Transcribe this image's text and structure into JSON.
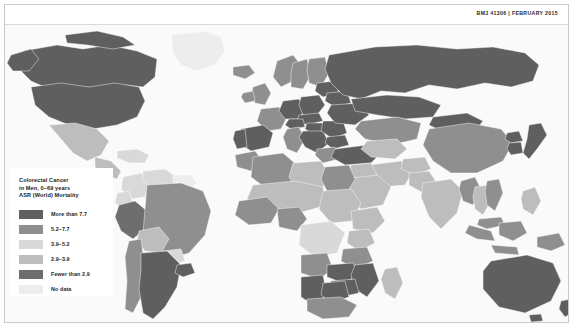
{
  "header": {
    "source_line": "BMJ 41306 | FEBRUARY 2015"
  },
  "legend": {
    "title": "Colorectal Cancer\nin Men, 0–69 years\nASR (World) Mortality",
    "title_line1": "Colorectal Cancer",
    "title_line2": "in Men, 0–69 years",
    "title_line3": "ASR (World) Mortality",
    "items": [
      {
        "label": "More than 7.7",
        "color": "#5f5f5f"
      },
      {
        "label": "5.2–7.7",
        "color": "#8f8f8f"
      },
      {
        "label": "3.9–5.2",
        "color": "#d9d9d9"
      },
      {
        "label": "2.9–3.9",
        "color": "#bdbdbd"
      },
      {
        "label": "Fewer than 2.9",
        "color": "#6e6e6e"
      },
      {
        "label": "No data",
        "color": "#ededed"
      }
    ]
  },
  "map": {
    "background_color": "#fafafa",
    "ocean_color": "#fafafa",
    "border_color": "#ffffff",
    "projection": "equirectangular-world",
    "regions": [
      {
        "name": "Canada",
        "class": "c1"
      },
      {
        "name": "United States",
        "class": "c1"
      },
      {
        "name": "Greenland",
        "class": "c6"
      },
      {
        "name": "Mexico",
        "class": "c4"
      },
      {
        "name": "Central America",
        "class": "c4"
      },
      {
        "name": "Caribbean",
        "class": "c3"
      },
      {
        "name": "Colombia",
        "class": "c3"
      },
      {
        "name": "Venezuela",
        "class": "c3"
      },
      {
        "name": "Guianas",
        "class": "c6"
      },
      {
        "name": "Brazil",
        "class": "c2"
      },
      {
        "name": "Peru",
        "class": "c5"
      },
      {
        "name": "Bolivia",
        "class": "c4"
      },
      {
        "name": "Chile",
        "class": "c2"
      },
      {
        "name": "Argentina",
        "class": "c1"
      },
      {
        "name": "Uruguay",
        "class": "c1"
      },
      {
        "name": "Paraguay",
        "class": "c3"
      },
      {
        "name": "Ecuador",
        "class": "c3"
      },
      {
        "name": "Iceland",
        "class": "c2"
      },
      {
        "name": "Norway",
        "class": "c2"
      },
      {
        "name": "Sweden",
        "class": "c2"
      },
      {
        "name": "Finland",
        "class": "c2"
      },
      {
        "name": "United Kingdom",
        "class": "c2"
      },
      {
        "name": "Ireland",
        "class": "c2"
      },
      {
        "name": "France",
        "class": "c2"
      },
      {
        "name": "Spain",
        "class": "c1"
      },
      {
        "name": "Portugal",
        "class": "c1"
      },
      {
        "name": "Germany",
        "class": "c1"
      },
      {
        "name": "Poland",
        "class": "c1"
      },
      {
        "name": "Czechia",
        "class": "c1"
      },
      {
        "name": "Slovakia",
        "class": "c1"
      },
      {
        "name": "Hungary",
        "class": "c1"
      },
      {
        "name": "Austria",
        "class": "c1"
      },
      {
        "name": "Italy",
        "class": "c2"
      },
      {
        "name": "Balkans",
        "class": "c1"
      },
      {
        "name": "Romania",
        "class": "c1"
      },
      {
        "name": "Bulgaria",
        "class": "c1"
      },
      {
        "name": "Greece",
        "class": "c2"
      },
      {
        "name": "Ukraine",
        "class": "c1"
      },
      {
        "name": "Belarus",
        "class": "c1"
      },
      {
        "name": "Baltics",
        "class": "c1"
      },
      {
        "name": "Russia",
        "class": "c1"
      },
      {
        "name": "Turkey",
        "class": "c1"
      },
      {
        "name": "Kazakhstan",
        "class": "c2"
      },
      {
        "name": "Central Asia",
        "class": "c4"
      },
      {
        "name": "Iran",
        "class": "c4"
      },
      {
        "name": "Iraq",
        "class": "c4"
      },
      {
        "name": "Saudi Arabia",
        "class": "c4"
      },
      {
        "name": "Arabian Peninsula",
        "class": "c4"
      },
      {
        "name": "Egypt",
        "class": "c2"
      },
      {
        "name": "Libya",
        "class": "c4"
      },
      {
        "name": "Algeria",
        "class": "c2"
      },
      {
        "name": "Morocco",
        "class": "c2"
      },
      {
        "name": "Sahel",
        "class": "c4"
      },
      {
        "name": "West Africa",
        "class": "c2"
      },
      {
        "name": "Nigeria",
        "class": "c2"
      },
      {
        "name": "Sudan",
        "class": "c4"
      },
      {
        "name": "Ethiopia",
        "class": "c4"
      },
      {
        "name": "Kenya",
        "class": "c4"
      },
      {
        "name": "DR Congo",
        "class": "c3"
      },
      {
        "name": "Angola",
        "class": "c2"
      },
      {
        "name": "Tanzania",
        "class": "c2"
      },
      {
        "name": "Zambia",
        "class": "c1"
      },
      {
        "name": "Zimbabwe",
        "class": "c1"
      },
      {
        "name": "Mozambique",
        "class": "c1"
      },
      {
        "name": "Namibia",
        "class": "c1"
      },
      {
        "name": "Botswana",
        "class": "c1"
      },
      {
        "name": "South Africa",
        "class": "c2"
      },
      {
        "name": "Madagascar",
        "class": "c4"
      },
      {
        "name": "India",
        "class": "c4"
      },
      {
        "name": "Pakistan",
        "class": "c4"
      },
      {
        "name": "Afghanistan",
        "class": "c4"
      },
      {
        "name": "China",
        "class": "c2"
      },
      {
        "name": "Mongolia",
        "class": "c1"
      },
      {
        "name": "Japan",
        "class": "c1"
      },
      {
        "name": "South Korea",
        "class": "c1"
      },
      {
        "name": "North Korea",
        "class": "c1"
      },
      {
        "name": "Myanmar",
        "class": "c2"
      },
      {
        "name": "Thailand",
        "class": "c4"
      },
      {
        "name": "Vietnam",
        "class": "c2"
      },
      {
        "name": "Indonesia",
        "class": "c2"
      },
      {
        "name": "Malaysia",
        "class": "c2"
      },
      {
        "name": "Philippines",
        "class": "c4"
      },
      {
        "name": "Papua New Guinea",
        "class": "c2"
      },
      {
        "name": "Australia",
        "class": "c1"
      },
      {
        "name": "New Zealand",
        "class": "c1"
      }
    ]
  }
}
